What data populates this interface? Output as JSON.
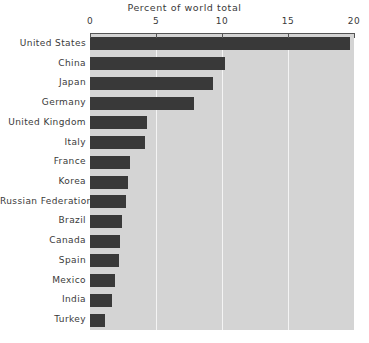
{
  "chart_data": {
    "type": "bar",
    "orientation": "horizontal",
    "title": "Percent of world total",
    "xlabel": "",
    "ylabel": "",
    "xlim": [
      0,
      20
    ],
    "xticks": [
      0,
      5,
      10,
      15,
      20
    ],
    "xtick_labels": [
      "0",
      "5",
      "10",
      "15",
      "20"
    ],
    "grid": "vertical",
    "legend": "none",
    "categories": [
      "United States",
      "China",
      "Japan",
      "Germany",
      "United Kingdom",
      "Italy",
      "France",
      "Korea",
      "Russian Federation",
      "Brazil",
      "Canada",
      "Spain",
      "Mexico",
      "India",
      "Turkey"
    ],
    "values": [
      19.7,
      10.2,
      9.3,
      7.9,
      4.3,
      4.2,
      3.0,
      2.9,
      2.7,
      2.4,
      2.3,
      2.2,
      1.9,
      1.7,
      1.1
    ],
    "bar_color": "#393939",
    "plot_background": "#d4d4d4",
    "gridline_color": "#f4f4f4"
  }
}
